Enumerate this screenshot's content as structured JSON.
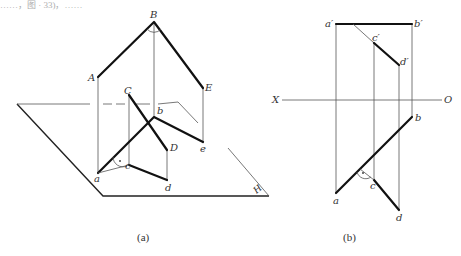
{
  "top_text": "……，图 · 33)，……",
  "figure_a": {
    "caption": "(a)",
    "labels": {
      "B": "B",
      "A": "A",
      "E": "E",
      "C": "C",
      "D": "D",
      "b": "b",
      "e": "e",
      "a": "a",
      "c": "c",
      "d": "d",
      "H": "H"
    }
  },
  "figure_b": {
    "caption": "(b)",
    "axis": {
      "X": "X",
      "O": "O"
    },
    "labels": {
      "a_prime": "a′",
      "b_prime": "b′",
      "c_prime": "c′",
      "d_prime": "d′",
      "b": "b",
      "a": "a",
      "c": "c",
      "d": "d"
    }
  }
}
